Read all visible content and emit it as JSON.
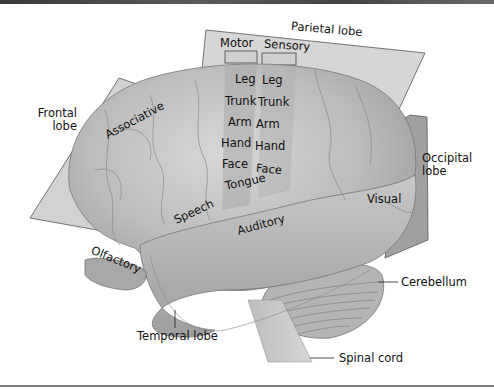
{
  "figure": {
    "lobes": {
      "frontal": "Frontal lobe",
      "parietal": "Parietal lobe",
      "occipital": "Occipital lobe",
      "temporal": "Temporal lobe"
    },
    "strips": {
      "motor": "Motor",
      "sensory": "Sensory"
    },
    "motor_map": [
      "Leg",
      "Trunk",
      "Arm",
      "Hand",
      "Face",
      "Tongue"
    ],
    "sensory_map": [
      "Leg",
      "Trunk",
      "Arm",
      "Hand",
      "Face"
    ],
    "areas": {
      "associative": "Associative",
      "speech": "Speech",
      "auditory": "Auditory",
      "visual": "Visual",
      "olfactory": "Olfactory"
    },
    "structures": {
      "cerebellum": "Cerebellum",
      "spinal_cord": "Spinal cord"
    },
    "colors": {
      "plane": "#d4d4d4",
      "plane_dark": "#9a9a9a",
      "brain": "#bdbdbd",
      "text": "#111111"
    }
  }
}
